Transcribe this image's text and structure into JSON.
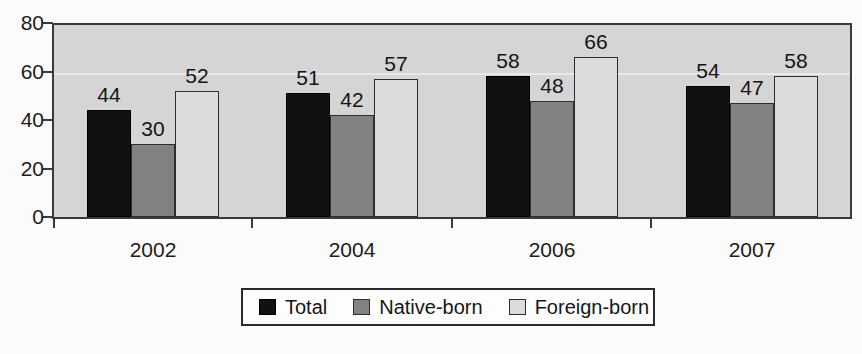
{
  "chart_data": {
    "type": "bar",
    "title": "",
    "subtitle": "",
    "xlabel": "",
    "ylabel": "",
    "categories": [
      "2002",
      "2004",
      "2006",
      "2007"
    ],
    "series": [
      {
        "name": "Total",
        "key": "total",
        "color": "#111111",
        "values": [
          44,
          51,
          58,
          54
        ]
      },
      {
        "name": "Native-born",
        "key": "native",
        "color": "#828282",
        "values": [
          30,
          42,
          48,
          47
        ]
      },
      {
        "name": "Foreign-born",
        "key": "foreign",
        "color": "#dcdcdc",
        "values": [
          52,
          57,
          66,
          58
        ]
      }
    ],
    "ylim": [
      0,
      80
    ],
    "yticks": [
      0,
      20,
      40,
      60,
      80
    ],
    "ytick_labels": [
      "0",
      "20",
      "40",
      "60",
      "80"
    ],
    "grid": true,
    "gridlines_at": [
      60
    ],
    "data_labels": true,
    "legend_position": "bottom-center",
    "plot_background": "#d5d5d5",
    "figure_background": "#fbfbfb",
    "axis_color": "#3a3a3a"
  },
  "legend": {
    "entries": [
      {
        "label": "Total",
        "swatch": "total"
      },
      {
        "label": "Native-born",
        "swatch": "native"
      },
      {
        "label": "Foreign-born",
        "swatch": "foreign"
      }
    ]
  }
}
